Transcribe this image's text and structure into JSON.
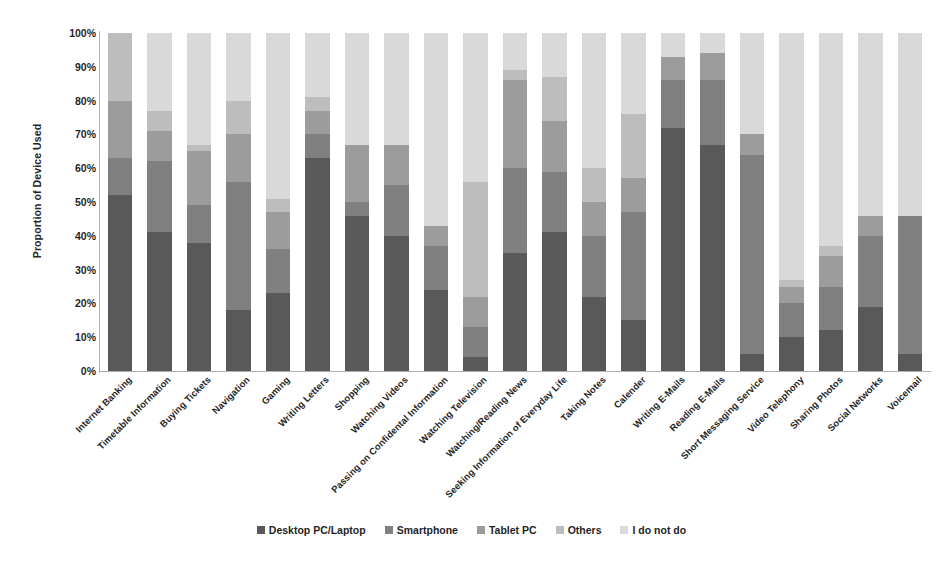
{
  "chart_data": {
    "type": "bar",
    "subtype": "stacked-100-percent",
    "title": "",
    "xlabel": "",
    "ylabel": "Proportion of Device Used",
    "ylim": [
      0,
      100
    ],
    "ytick_labels": [
      "100%",
      "90%",
      "80%",
      "70%",
      "60%",
      "50%",
      "40%",
      "30%",
      "20%",
      "10%",
      "0%"
    ],
    "ytick_values": [
      100,
      90,
      80,
      70,
      60,
      50,
      40,
      30,
      20,
      10,
      0
    ],
    "grid": false,
    "legend_position": "bottom",
    "legend": [
      "Desktop PC/Laptop",
      "Smartphone",
      "Tablet PC",
      "Others",
      "I do not do"
    ],
    "colors": [
      "#595959",
      "#808080",
      "#9c9c9c",
      "#bdbdbd",
      "#d9d9d9"
    ],
    "categories": [
      "Internet Banking",
      "Timetable Information",
      "Buying Tickets",
      "Navigation",
      "Gaming",
      "Writing Letters",
      "Shopping",
      "Watching Videos",
      "Passing on Confidental Information",
      "Watching Television",
      "Watching/Reading News",
      "Seeking Information of Everyday Life",
      "Taking Notes",
      "Calender",
      "Writing E-Mails",
      "Reading E-Mails",
      "Short Messaging Service",
      "Video Telephony",
      "Sharing Photos",
      "Social Networks",
      "Voicemail"
    ],
    "series": [
      {
        "name": "Desktop PC/Laptop",
        "color": "#595959",
        "values": [
          52,
          41,
          38,
          18,
          23,
          63,
          46,
          40,
          24,
          4,
          35,
          41,
          22,
          15,
          72,
          67,
          5,
          10,
          12,
          19,
          5
        ]
      },
      {
        "name": "Smartphone",
        "color": "#808080",
        "values": [
          11,
          21,
          11,
          38,
          13,
          7,
          4,
          15,
          13,
          9,
          25,
          18,
          18,
          32,
          14,
          19,
          59,
          10,
          13,
          21,
          41
        ]
      },
      {
        "name": "Tablet PC",
        "color": "#9c9c9c",
        "values": [
          17,
          9,
          16,
          14,
          11,
          7,
          17,
          12,
          6,
          9,
          26,
          15,
          10,
          10,
          7,
          8,
          6,
          5,
          9,
          6,
          0
        ]
      },
      {
        "name": "Others",
        "color": "#bdbdbd",
        "values": [
          20,
          6,
          2,
          10,
          4,
          4,
          0,
          0,
          0,
          34,
          3,
          13,
          10,
          19,
          0,
          0,
          0,
          2,
          3,
          0,
          0
        ]
      },
      {
        "name": "I do not do",
        "color": "#d9d9d9",
        "values": [
          0,
          23,
          33,
          20,
          49,
          19,
          33,
          33,
          57,
          44,
          11,
          13,
          40,
          24,
          7,
          6,
          30,
          73,
          63,
          54,
          54
        ]
      }
    ],
    "stack_tops": {
      "desktop": [
        52,
        41,
        38,
        18,
        23,
        63,
        46,
        40,
        24,
        4,
        35,
        41,
        22,
        15,
        72,
        67,
        5,
        10,
        12,
        19,
        5
      ],
      "smartphone": [
        63,
        62,
        49,
        56,
        36,
        70,
        50,
        55,
        37,
        13,
        60,
        59,
        40,
        47,
        86,
        86,
        64,
        20,
        25,
        40,
        46
      ],
      "tablet": [
        80,
        71,
        65,
        70,
        47,
        77,
        67,
        67,
        43,
        22,
        86,
        74,
        50,
        57,
        93,
        94,
        70,
        25,
        34,
        46,
        46
      ],
      "others": [
        100,
        77,
        67,
        80,
        51,
        81,
        67,
        67,
        43,
        56,
        89,
        87,
        60,
        76,
        93,
        94,
        70,
        27,
        37,
        46,
        46
      ],
      "idonotdo": [
        100,
        100,
        100,
        100,
        100,
        100,
        100,
        100,
        100,
        100,
        100,
        100,
        100,
        100,
        100,
        100,
        100,
        100,
        100,
        100,
        100
      ]
    }
  }
}
